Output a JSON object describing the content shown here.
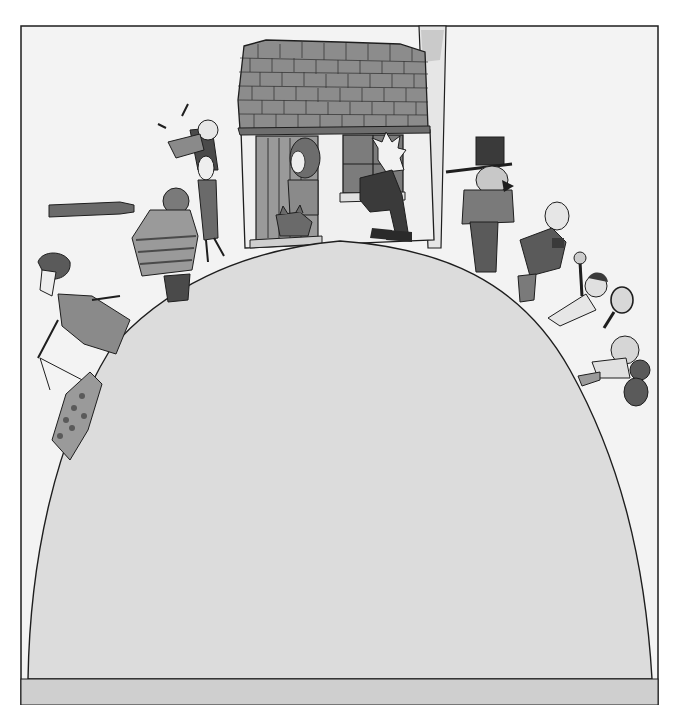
{
  "illustration": {
    "style": "grayscale watercolor book illustration",
    "colors": {
      "page": "#ffffff",
      "sky": "#f3f3f3",
      "hill": "#dcdcdc",
      "ground_band": "#cfcfcf",
      "ink": "#1e1e1e",
      "roof": "#8c8c8c",
      "wall": "#f0f0f0",
      "dark": "#3a3a3a",
      "mid": "#7a7a7a",
      "light": "#b5b5b5"
    },
    "scene": {
      "house": {
        "parts": [
          "tiled-roof",
          "chimney",
          "door",
          "window"
        ]
      },
      "figures": [
        "woman-at-door-with-cat",
        "man-sitting-on-windowsill",
        "man-in-top-hat",
        "bald-man-holding-book",
        "boy-with-tennis-racket",
        "girl-with-teddy-bear",
        "woman-holding-child-up",
        "sailor-with-telescope",
        "woman-walking-dog",
        "spotted-dog"
      ]
    }
  }
}
